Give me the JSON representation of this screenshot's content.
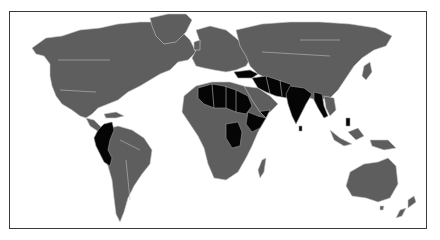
{
  "map": {
    "type": "world-choropleth",
    "style": "grayscale",
    "colors": {
      "background": "#ffffff",
      "base_land": "#5e5e5e",
      "highlighted": "#050505",
      "borders": "#c8c8c8",
      "frame": "#3a3a3a"
    },
    "highlighted_regions": [
      "Colombia",
      "Ecuador",
      "Peru",
      "Mali",
      "Niger",
      "Chad",
      "Sudan",
      "Nigeria",
      "Ethiopia",
      "Somalia",
      "Central African Republic",
      "Democratic Republic of the Congo",
      "Libya (south)",
      "Turkey",
      "Syria",
      "Iraq",
      "Iran",
      "Afghanistan",
      "Pakistan",
      "Yemen",
      "India",
      "Nepal",
      "Bangladesh",
      "Myanmar",
      "Thailand",
      "Philippines",
      "Sri Lanka"
    ]
  }
}
